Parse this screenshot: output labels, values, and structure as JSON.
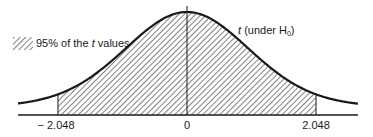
{
  "chart_data": {
    "type": "area",
    "title": "",
    "distribution": "t",
    "xlabel": "",
    "ylabel": "",
    "x_ticks": [
      -2.048,
      0,
      2.048
    ],
    "tick_labels": [
      "− 2.048",
      "0",
      "2.048"
    ],
    "shaded_region": {
      "from": -2.048,
      "to": 2.048,
      "pattern": "diagonal-hatch",
      "proportion": 0.95
    },
    "curve_label": {
      "var": "t",
      "text": "(under H",
      "sub": "0",
      "close": ")"
    },
    "legend": [
      {
        "swatch": "diagonal-hatch",
        "pre": "95% of the ",
        "var": "t",
        "post": " values"
      }
    ],
    "center_line_at": 0,
    "grid": false
  },
  "colors": {
    "ink": "#1a1a1a",
    "background": "#ffffff"
  }
}
